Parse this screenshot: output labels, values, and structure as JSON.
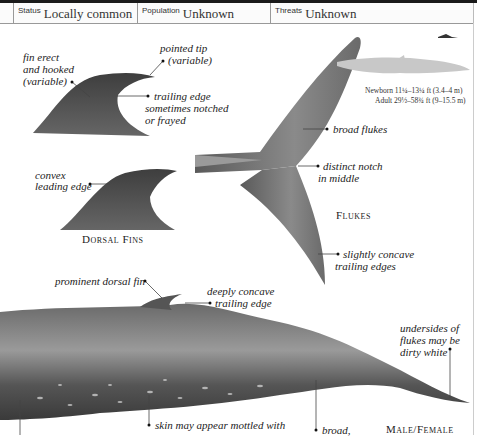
{
  "info_bar": {
    "status": {
      "label": "Status",
      "value": "Locally common"
    },
    "population": {
      "label": "Population",
      "value": "Unknown"
    },
    "threats": {
      "label": "Threats",
      "value": "Unknown"
    }
  },
  "size_box": {
    "newborn": "Newborn 11¼–13¼ ft (3.4–4 m)",
    "adult": "Adult 29½–58¾ ft (9–15.5 m)"
  },
  "dorsal_fins": {
    "caption": "Dorsal Fins",
    "annotations": [
      "fin erect",
      "and hooked",
      "(variable)",
      "pointed tip",
      "(variable)",
      "trailing edge",
      "sometimes notched",
      "or frayed",
      "convex",
      "leading edge"
    ]
  },
  "flukes": {
    "caption": "Flukes",
    "annotations": [
      "broad flukes",
      "distinct notch",
      "in middle",
      "slightly concave",
      "trailing edges"
    ]
  },
  "body": {
    "caption": "Male/Female",
    "annotations": [
      "prominent dorsal fin",
      "deeply concave",
      "trailing edge",
      "undersides of",
      "flukes may be",
      "dirty white",
      "skin may appear mottled with",
      "broad,"
    ]
  },
  "colors": {
    "whale_dark": "#4a4a4a",
    "whale_mid": "#7a7a7a",
    "silhouette": "#c8c8c8"
  }
}
